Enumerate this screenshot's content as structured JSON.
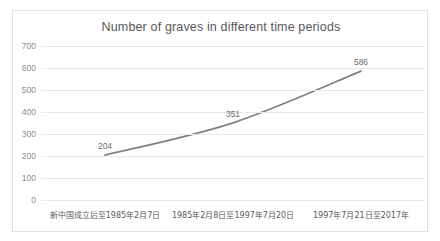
{
  "chart_data": {
    "type": "line",
    "title": "Number of graves in different time periods",
    "xlabel": "",
    "ylabel": "",
    "categories": [
      "新中国成立后至1985年2月7日",
      "1985年2月8日至1997年7月20日",
      "1997年7月21日至2017年"
    ],
    "values": [
      204,
      351,
      586
    ],
    "data_labels": [
      "204",
      "351",
      "586"
    ],
    "ylim": [
      0,
      700
    ],
    "ytick_step": 100,
    "yticks": [
      "700",
      "600",
      "500",
      "400",
      "300",
      "200",
      "100",
      "0"
    ],
    "ytick_values": [
      700,
      600,
      500,
      400,
      300,
      200,
      100,
      0
    ],
    "grid": true,
    "grid_axis": "y",
    "legend": false,
    "smooth": true,
    "markers": false,
    "series": [
      {
        "name": "Number of graves",
        "values": [
          204,
          351,
          586
        ]
      }
    ],
    "colors": {
      "line": "#808285",
      "grid": "#e9e9e9",
      "border": "#e2e2e2",
      "title_text": "#59595b",
      "tick_text": "#8c8c8e",
      "label_text": "#6a6a6c",
      "background": "#ffffff"
    }
  }
}
